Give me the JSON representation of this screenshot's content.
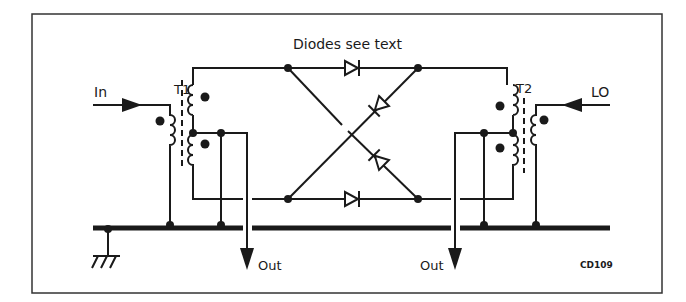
{
  "diagram": {
    "type": "schematic",
    "labels": {
      "diodes_note": "Diodes see text",
      "input": "In",
      "local_oscillator": "LO",
      "output_left": "Out",
      "output_right": "Out",
      "transformer_1": "T1",
      "transformer_2": "T2",
      "figure_code": "CD109"
    },
    "components": [
      {
        "id": "T1",
        "kind": "transformer",
        "windings": [
          "primary",
          "center-tapped secondary"
        ]
      },
      {
        "id": "T2",
        "kind": "transformer",
        "windings": [
          "center-tapped primary",
          "secondary"
        ]
      },
      {
        "id": "D1",
        "kind": "diode",
        "position": "top rail",
        "direction": "right"
      },
      {
        "id": "D2",
        "kind": "diode",
        "position": "bottom rail",
        "direction": "right"
      },
      {
        "id": "D3",
        "kind": "diode",
        "position": "cross diagonal up",
        "direction": "up-right"
      },
      {
        "id": "D4",
        "kind": "diode",
        "position": "cross diagonal down",
        "direction": "up-left"
      },
      {
        "id": "GND",
        "kind": "ground"
      }
    ],
    "colors": {
      "stroke": "#1a1a1a",
      "background": "#ffffff",
      "frame": "#333333"
    }
  }
}
